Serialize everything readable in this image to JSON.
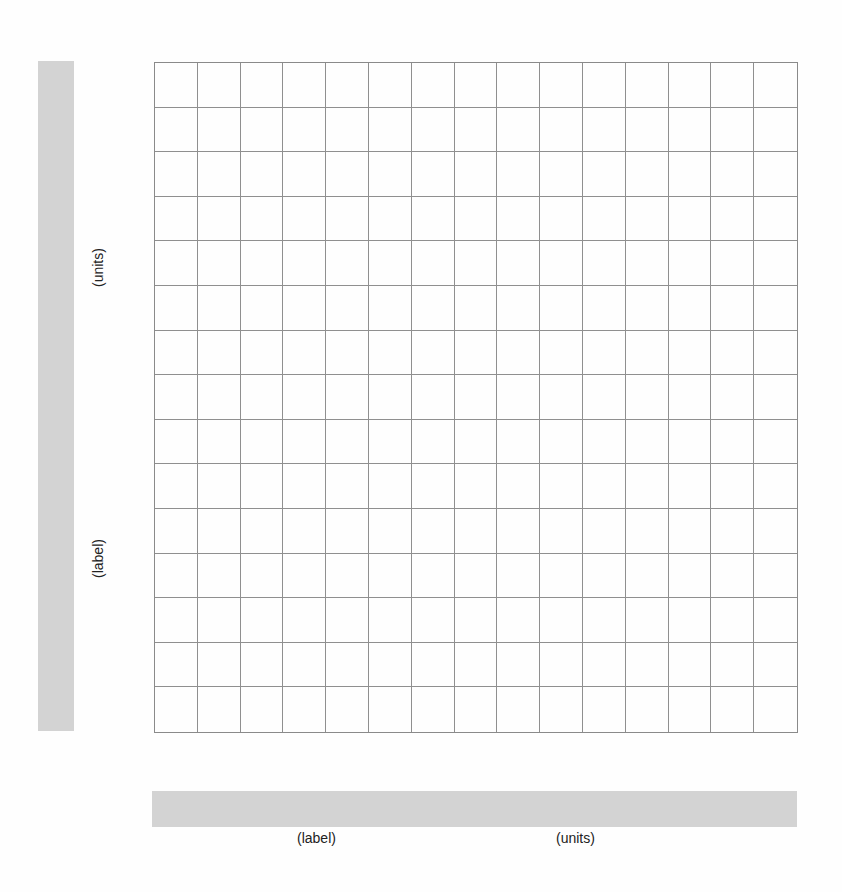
{
  "chart_data": {
    "type": "grid",
    "title": "",
    "xlabel": "(label)",
    "xunits": "(units)",
    "ylabel": "(label)",
    "yunits": "(units)",
    "columns": 15,
    "rows": 15,
    "grid": true,
    "series": []
  },
  "y_axis": {
    "label": "(label)",
    "units": "(units)",
    "bar_color": "#d3d3d3"
  },
  "x_axis": {
    "label": "(label)",
    "units": "(units)",
    "bar_color": "#d3d3d3"
  },
  "grid": {
    "columns": 15,
    "rows": 15,
    "line_color": "#8f8f8f"
  }
}
